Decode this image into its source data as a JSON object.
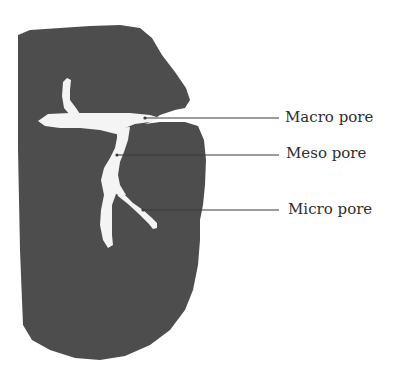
{
  "figure": {
    "colors": {
      "particle": "#4d4d4d",
      "pore": "#f4f4f4",
      "leader_line": "#3a3a3a",
      "label_text": "#2e2e2e",
      "background": "#ffffff"
    },
    "labels": [
      {
        "id": "macro",
        "text": "Macro pore"
      },
      {
        "id": "meso",
        "text": "Meso pore"
      },
      {
        "id": "micro",
        "text": "Micro pore"
      }
    ]
  }
}
